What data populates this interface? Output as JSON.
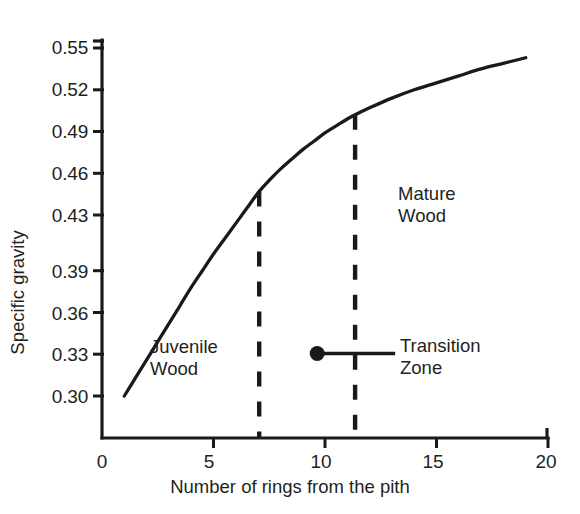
{
  "chart_data": {
    "type": "line",
    "title": "",
    "xlabel": "Number of rings from the pith",
    "ylabel": "Specific gravity",
    "xlim": [
      0,
      20
    ],
    "ylim": [
      0.285,
      0.5675
    ],
    "grid": false,
    "legend": "none",
    "xticks": [
      0,
      5,
      10,
      15,
      20
    ],
    "xtick_labels": [
      "0",
      "5",
      "10",
      "15",
      "20"
    ],
    "yticks": [
      0.3,
      0.33,
      0.36,
      0.39,
      0.43,
      0.46,
      0.49,
      0.52,
      0.55
    ],
    "ytick_labels": [
      "0.30",
      "0.33",
      "0.36",
      "0.39",
      "0.43",
      "0.46",
      "0.49",
      "0.52",
      "0.55"
    ],
    "series": [
      {
        "name": "Specific gravity curve",
        "x": [
          1.0,
          1.5,
          2.0,
          2.5,
          3.0,
          3.5,
          4.0,
          4.5,
          5.0,
          5.5,
          6.0,
          6.5,
          7.05,
          7.5,
          8.0,
          8.5,
          9.0,
          9.5,
          10.0,
          10.5,
          11.0,
          11.35,
          12.0,
          13.0,
          14.0,
          15.0,
          16.0,
          17.0,
          18.0,
          19.0
        ],
        "y": [
          0.3,
          0.313,
          0.326,
          0.339,
          0.352,
          0.365,
          0.378,
          0.39,
          0.402,
          0.413,
          0.424,
          0.435,
          0.447,
          0.455,
          0.463,
          0.47,
          0.477,
          0.483,
          0.489,
          0.494,
          0.499,
          0.502,
          0.507,
          0.514,
          0.52,
          0.525,
          0.53,
          0.535,
          0.539,
          0.543
        ]
      }
    ],
    "vertical_dashed_lines": [
      {
        "name": "juvenile-transition-boundary",
        "x": 7.05
      },
      {
        "name": "transition-mature-boundary",
        "x": 11.35
      }
    ],
    "annotations": [
      {
        "name": "juvenile-wood",
        "lines": [
          "Juvenile",
          "Wood"
        ],
        "x": 2.15,
        "y": 0.327
      },
      {
        "name": "mature-wood",
        "lines": [
          "Mature",
          "Wood"
        ],
        "x": 13.3,
        "y": 0.447
      },
      {
        "name": "transition-zone",
        "lines": [
          "Transition",
          "Zone"
        ],
        "x": 13.4,
        "y": 0.333
      }
    ],
    "leader": {
      "name": "transition-zone-leader",
      "dot_x": 9.65,
      "dot_y": 0.3305,
      "end_x": 13.15,
      "end_y": 0.3305
    },
    "colors": {
      "line": "#1a1a1a",
      "axis": "#1a1a1a",
      "text": "#231f20",
      "background": "#ffffff"
    }
  },
  "axis": {
    "y_title": "Specific gravity",
    "x_title": "Number of rings from the pith"
  },
  "ticks": {
    "y": [
      {
        "label": "0.55",
        "top": 38
      },
      {
        "label": "0.52",
        "top": 80
      },
      {
        "label": "0.49",
        "top": 122
      },
      {
        "label": "0.46",
        "top": 164
      },
      {
        "label": "0.43",
        "top": 206
      },
      {
        "label": "0.39",
        "top": 262
      },
      {
        "label": "0.36",
        "top": 304
      },
      {
        "label": "0.33",
        "top": 345
      },
      {
        "label": "0.30",
        "top": 387
      }
    ],
    "x": [
      {
        "label": "0",
        "left": 102
      },
      {
        "label": "5",
        "left": 209
      },
      {
        "label": "10",
        "left": 321
      },
      {
        "label": "15",
        "left": 433
      },
      {
        "label": "20",
        "left": 546
      }
    ]
  },
  "annotations": {
    "juvenile_line1": "Juvenile",
    "juvenile_line2": "Wood",
    "mature_line1": "Mature",
    "mature_line2": "Wood",
    "transition_line1": "Transition",
    "transition_line2": "Zone"
  }
}
